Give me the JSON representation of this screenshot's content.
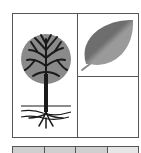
{
  "figure": {
    "panels": [
      {
        "id": "tree",
        "icon": "tree-with-roots-icon",
        "description": "tree with canopy, trunk and roots"
      },
      {
        "id": "leaf",
        "icon": "leaf-icon",
        "description": "single leaf"
      },
      {
        "id": "empty",
        "icon": null,
        "description": "empty cell"
      }
    ],
    "strip": {
      "cells": [
        {
          "fill": "#cfcfcf"
        },
        {
          "fill": "#cfcfcf"
        },
        {
          "fill": "#cfcfcf"
        },
        {
          "fill": "#e6e6e6"
        }
      ]
    },
    "colors": {
      "border": "#555555",
      "canopy": "#8a8a8a",
      "branches": "#1a1a1a",
      "leaf_dark": "#6e6e6e",
      "leaf_light": "#9a9a9a"
    }
  }
}
